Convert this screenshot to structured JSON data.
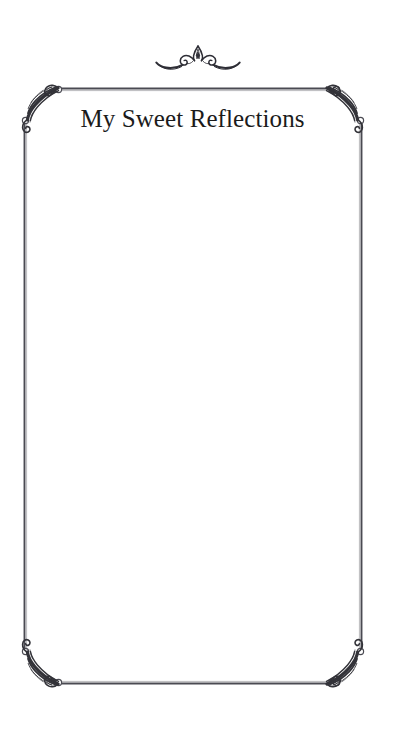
{
  "page": {
    "title": "My Sweet Reflections",
    "background_color": "#ffffff",
    "ink_color": "#3a3a42",
    "title_color": "#1b1b1b",
    "width": 395,
    "height": 733
  },
  "ornaments": {
    "top_flourish": "scrollwork-flourish-ornament",
    "corner_top_left": "corner-leaf-flourish",
    "corner_top_right": "corner-leaf-flourish",
    "corner_bottom_left": "corner-leaf-flourish",
    "corner_bottom_right": "corner-leaf-flourish"
  },
  "frame": {
    "left": 24,
    "right": 361,
    "top": 88,
    "bottom": 683
  },
  "writing_area": {
    "entry_text": "",
    "placeholder": ""
  }
}
